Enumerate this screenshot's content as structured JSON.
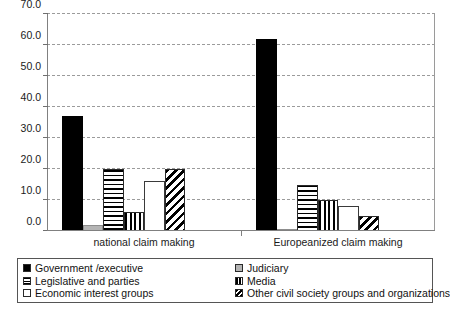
{
  "chart_data": {
    "type": "bar",
    "title": "",
    "subtitle": "",
    "xlabel": "",
    "ylabel": "",
    "categories": [
      "national claim making",
      "Europeanized claim making"
    ],
    "ylim": [
      0.0,
      70.0
    ],
    "ytick_labels": [
      "0.0",
      "10.0",
      "20.0",
      "30.0",
      "40.0",
      "50.0",
      "60.0",
      "70.0"
    ],
    "ytick_values": [
      0.0,
      10.0,
      20.0,
      30.0,
      40.0,
      50.0,
      60.0,
      70.0
    ],
    "grid": "horizontal-dashed",
    "legend_position": "bottom",
    "series": [
      {
        "name": "Government /executive",
        "pattern": "solid-black",
        "color": "#000000",
        "values": [
          37.0,
          62.0
        ]
      },
      {
        "name": "Judiciary",
        "pattern": "light-gray",
        "color": "#b4b4b4",
        "values": [
          2.0,
          0.5
        ]
      },
      {
        "name": "Legislative and parties",
        "pattern": "horizontal-lines",
        "color": "#000000",
        "values": [
          20.0,
          15.0
        ]
      },
      {
        "name": "Media",
        "pattern": "vertical-lines",
        "color": "#000000",
        "values": [
          6.0,
          10.0
        ]
      },
      {
        "name": "Economic interest groups",
        "pattern": "white-empty",
        "color": "#ffffff",
        "values": [
          16.0,
          8.0
        ]
      },
      {
        "name": "Other civil society groups and organizations",
        "pattern": "diagonal-hatch",
        "color": "#000000",
        "values": [
          20.0,
          5.0
        ]
      }
    ]
  },
  "legend": {
    "entries": [
      {
        "label": "Government /executive",
        "pattern": "solid-black"
      },
      {
        "label": "Judiciary",
        "pattern": "light-gray"
      },
      {
        "label": "Legislative and parties",
        "pattern": "horizontal-lines"
      },
      {
        "label": "Media",
        "pattern": "vertical-lines"
      },
      {
        "label": "Economic interest groups",
        "pattern": "white-empty"
      },
      {
        "label": "Other civil society groups and organizations",
        "pattern": "diagonal-hatch"
      }
    ]
  }
}
